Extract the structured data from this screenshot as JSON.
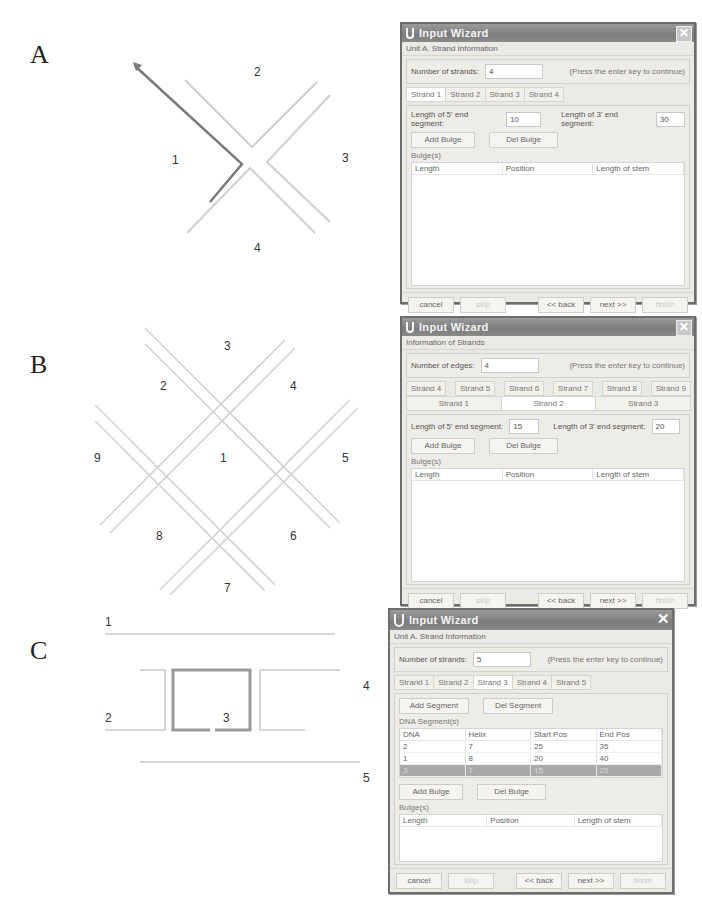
{
  "panels": {
    "A": {
      "letter": "A",
      "diagram_labels": [
        "1",
        "2",
        "3",
        "4"
      ],
      "wizard": {
        "title": "Input Wizard",
        "section": "Unit A. Strand Information",
        "count_label": "Number of strands:",
        "count_value": "4",
        "hint": "(Press the enter key to continue)",
        "tabs": [
          "Strand 1",
          "Strand 2",
          "Strand 3",
          "Strand 4"
        ],
        "active_tab": 0,
        "len5_label": "Length of 5' end segment:",
        "len5_value": "10",
        "len3_label": "Length of 3' end segment:",
        "len3_value": "30",
        "add_bulge": "Add Bulge",
        "del_bulge": "Del Bulge",
        "bulges_title": "Bulge(s)",
        "bulge_columns": [
          "Length",
          "Position",
          "Length of stem"
        ],
        "footer": {
          "cancel": "cancel",
          "skip": "skip",
          "back": "<< back",
          "next": "next >>",
          "finish": "finish"
        }
      }
    },
    "B": {
      "letter": "B",
      "diagram_labels": [
        "1",
        "2",
        "3",
        "4",
        "5",
        "6",
        "7",
        "8",
        "9"
      ],
      "wizard": {
        "title": "Input Wizard",
        "section": "Information of Strands",
        "count_label": "Number of edges:",
        "count_value": "4",
        "hint": "(Press the enter key to continue)",
        "tabs_row1": [
          "Strand 4",
          "Strand 5",
          "Strand 6",
          "Strand 7",
          "Strand 8",
          "Strand 9"
        ],
        "tabs_row2": [
          "Strand 1",
          "Strand 2",
          "Strand 3"
        ],
        "active_tab": "Strand 2",
        "len5_label": "Length of 5' end segment:",
        "len5_value": "15",
        "len3_label": "Length of 3' end segment:",
        "len3_value": "20",
        "add_bulge": "Add Bulge",
        "del_bulge": "Del Bulge",
        "bulges_title": "Bulge(s)",
        "bulge_columns": [
          "Length",
          "Position",
          "Length of stem"
        ],
        "footer": {
          "cancel": "cancel",
          "skip": "skip",
          "back": "<< back",
          "next": "next >>",
          "finish": "finish"
        }
      }
    },
    "C": {
      "letter": "C",
      "diagram_labels": [
        "1",
        "2",
        "3",
        "4",
        "5"
      ],
      "wizard": {
        "title": "Input Wizard",
        "section": "Unit A. Strand Information",
        "count_label": "Number of strands:",
        "count_value": "5",
        "hint": "(Press the enter key to continue)",
        "tabs": [
          "Strand 1",
          "Strand 2",
          "Strand 3",
          "Strand 4",
          "Strand 5"
        ],
        "active_tab": 2,
        "add_segment": "Add Segment",
        "del_segment": "Del Segment",
        "segments_title": "DNA Segment(s)",
        "segment_columns": [
          "DNA",
          "Helix",
          "Start Pos",
          "End Pos"
        ],
        "segment_rows": [
          [
            "2",
            "7",
            "25",
            "35"
          ],
          [
            "1",
            "8",
            "20",
            "40"
          ],
          [
            "3",
            "7",
            "15",
            "25"
          ]
        ],
        "selected_row": 2,
        "add_bulge": "Add Bulge",
        "del_bulge": "Del Bulge",
        "bulges_title": "Bulge(s)",
        "bulge_columns": [
          "Length",
          "Position",
          "Length of stem"
        ],
        "footer": {
          "cancel": "cancel",
          "skip": "skip",
          "back": "<< back",
          "next": "next >>",
          "finish": "finish"
        }
      }
    }
  }
}
